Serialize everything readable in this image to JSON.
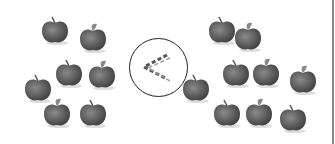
{
  "comparison": {
    "left_group": {
      "label": "left apples",
      "count": 7,
      "apples": [
        [
          55,
          30
        ],
        [
          93,
          38
        ],
        [
          69,
          73
        ],
        [
          102,
          75
        ],
        [
          38,
          88
        ],
        [
          57,
          113
        ],
        [
          93,
          113
        ]
      ]
    },
    "symbol": {
      "glyph": "<",
      "meaning": "less than",
      "style": "dashed"
    },
    "right_group": {
      "label": "right apples",
      "count": 9,
      "apples": [
        [
          222,
          30
        ],
        [
          248,
          37
        ],
        [
          236,
          73
        ],
        [
          266,
          73
        ],
        [
          196,
          88
        ],
        [
          303,
          80
        ],
        [
          227,
          113
        ],
        [
          259,
          113
        ],
        [
          293,
          118
        ]
      ]
    }
  },
  "colors": {
    "apple": "#6e6e6e",
    "apple_dark": "#4a4a4a",
    "circle": "#222222",
    "symbol": "#555555",
    "edge": "#888888"
  }
}
